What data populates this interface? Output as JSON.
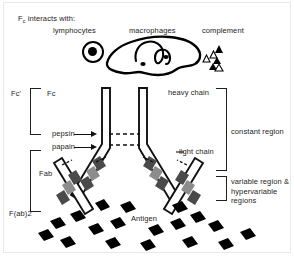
{
  "figure": {
    "title_prefix": "F",
    "title_sub": "c",
    "title_rest": " interacts with:",
    "header_labels": {
      "lymphocytes": "lymphocytes",
      "macrophages": "macrophages",
      "complement": "complement"
    },
    "left_labels": {
      "fc_prime": "Fc'",
      "fc": "Fc",
      "fab": "Fab",
      "fab2": "F(ab)2"
    },
    "enzymes": {
      "pepsin": "pepsin",
      "papain": "papain"
    },
    "right_labels": {
      "heavy_chain": "heavy chain",
      "light_chain": "light chain",
      "constant_region": "constant region",
      "variable_region": "variable region & hypervariable regions"
    },
    "antigen_label": "Antigen",
    "colors": {
      "ink": "#111111",
      "background": "#ffffff",
      "band_dark": "#4a4a4a",
      "band_mid": "#8c8c8c",
      "frame": "#e9e9e9"
    }
  }
}
